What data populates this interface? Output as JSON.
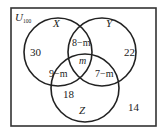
{
  "diagram": {
    "type": "venn",
    "universe": {
      "label": "U",
      "subscript": "100"
    },
    "sets": [
      {
        "name": "X"
      },
      {
        "name": "Y"
      },
      {
        "name": "Z"
      }
    ],
    "regions": {
      "x_only": "30",
      "y_only": "22",
      "z_only": "18",
      "x_and_y_only": "8−m",
      "x_and_z_only": "9−m",
      "y_and_z_only": "7−m",
      "x_y_z": "m",
      "outside": "14"
    },
    "colors": {
      "stroke": "#222222",
      "background": "#ffffff"
    }
  }
}
